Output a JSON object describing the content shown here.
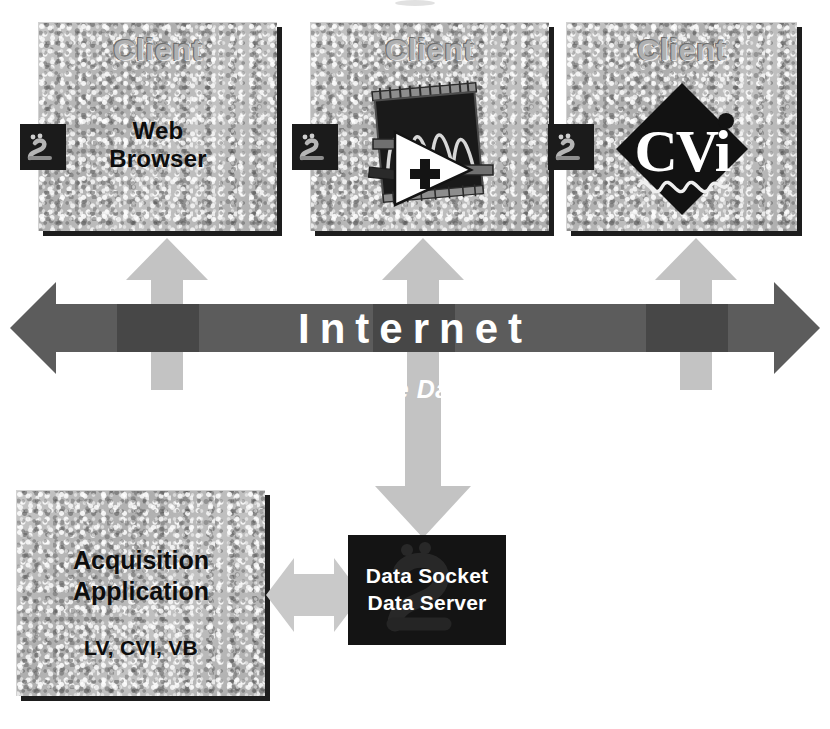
{
  "diagram": {
    "colors": {
      "panel_stone": "#b9b9b9",
      "panel_shadow": "#1d1d1d",
      "internet_arrow": "#5c5c5c",
      "internet_arrow_overlap": "#4a4a4a",
      "vertical_arrow": "#c3c3c3",
      "dark_box": "#141414",
      "label_white": "#ffffff",
      "text_black": "#0d0d0d",
      "emboss_gray": "#b0b0b0"
    },
    "clients": [
      {
        "header": "Client",
        "line1": "Web",
        "line2": "Browser",
        "icon": "web-browser-text",
        "connector_icon": "datasocket-plug-icon"
      },
      {
        "header": "Client",
        "line1": "",
        "line2": "",
        "icon": "labview-icon",
        "connector_icon": "datasocket-plug-icon"
      },
      {
        "header": "Client",
        "line1": "",
        "line2": "",
        "icon": "cvi-icon",
        "icon_text": "CVi",
        "connector_icon": "datasocket-plug-icon"
      }
    ],
    "internet": {
      "label": "Internet",
      "sublabel": "Live Data",
      "arrow_icon": "bidirectional-horizontal-arrow"
    },
    "acquisition": {
      "line1": "Acquisition",
      "line2": "Application",
      "sublabel": "LV, CVI, VB"
    },
    "server": {
      "line1": "Data Socket",
      "line2": "Data Server",
      "watermark_icon": "datasocket-plug-icon"
    },
    "arrows": {
      "client_uplink_icon": "up-arrow",
      "server_downlink_icon": "down-arrow",
      "acquisition_link_icon": "bidirectional-horizontal-arrow"
    }
  }
}
